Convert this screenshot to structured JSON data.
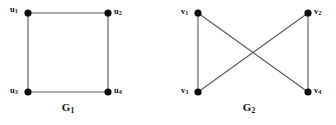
{
  "figure": {
    "width": 336,
    "height": 125,
    "background_color": "#ffffff",
    "edge_color": "#5a5a5a",
    "vertex_color": "#0d0d0d",
    "label_color": "#101010",
    "vertex_radius": 3.6
  },
  "graphs": [
    {
      "id": "G1",
      "caption_base": "G",
      "caption_sub": "1",
      "caption_text": "G1",
      "caption_x": 68,
      "caption_y": 111,
      "vertices": [
        {
          "id": "u1",
          "label_base": "u",
          "label_sub": "1",
          "label_text": "u1",
          "x": 28,
          "y": 13,
          "label_x": 10,
          "label_y": 12
        },
        {
          "id": "u2",
          "label_base": "u",
          "label_sub": "2",
          "label_text": "u2",
          "x": 108,
          "y": 13,
          "label_x": 114,
          "label_y": 14
        },
        {
          "id": "u3",
          "label_base": "u",
          "label_sub": "3",
          "label_text": "u3",
          "x": 28,
          "y": 92,
          "label_x": 10,
          "label_y": 93
        },
        {
          "id": "u4",
          "label_base": "u",
          "label_sub": "4",
          "label_text": "u4",
          "x": 108,
          "y": 92,
          "label_x": 114,
          "label_y": 93
        }
      ],
      "edges": [
        {
          "id": "u1-u2",
          "from": "u1",
          "to": "u2",
          "x1": 28,
          "y1": 13,
          "x2": 108,
          "y2": 13
        },
        {
          "id": "u1-u3",
          "from": "u1",
          "to": "u3",
          "x1": 28,
          "y1": 13,
          "x2": 28,
          "y2": 92
        },
        {
          "id": "u3-u4",
          "from": "u3",
          "to": "u4",
          "x1": 28,
          "y1": 92,
          "x2": 108,
          "y2": 92
        },
        {
          "id": "u2-u4",
          "from": "u2",
          "to": "u4",
          "x1": 108,
          "y1": 13,
          "x2": 108,
          "y2": 92
        }
      ]
    },
    {
      "id": "G2",
      "caption_base": "G",
      "caption_sub": "2",
      "caption_text": "G2",
      "caption_x": 249,
      "caption_y": 111,
      "vertices": [
        {
          "id": "v1",
          "label_base": "v",
          "label_sub": "1",
          "label_text": "v1",
          "x": 198,
          "y": 13,
          "label_x": 181,
          "label_y": 14
        },
        {
          "id": "v2",
          "label_base": "v",
          "label_sub": "2",
          "label_text": "v2",
          "x": 308,
          "y": 13,
          "label_x": 314,
          "label_y": 14
        },
        {
          "id": "v3",
          "label_base": "v",
          "label_sub": "3",
          "label_text": "v3",
          "x": 198,
          "y": 92,
          "label_x": 181,
          "label_y": 93
        },
        {
          "id": "v4",
          "label_base": "v",
          "label_sub": "4",
          "label_text": "v4",
          "x": 308,
          "y": 92,
          "label_x": 314,
          "label_y": 93
        }
      ],
      "edges": [
        {
          "id": "v1-v3",
          "from": "v1",
          "to": "v3",
          "x1": 198,
          "y1": 13,
          "x2": 198,
          "y2": 92
        },
        {
          "id": "v2-v4",
          "from": "v2",
          "to": "v4",
          "x1": 308,
          "y1": 13,
          "x2": 308,
          "y2": 92
        },
        {
          "id": "v1-v4",
          "from": "v1",
          "to": "v4",
          "x1": 198,
          "y1": 13,
          "x2": 308,
          "y2": 92
        },
        {
          "id": "v2-v3",
          "from": "v2",
          "to": "v3",
          "x1": 308,
          "y1": 13,
          "x2": 198,
          "y2": 92
        }
      ]
    }
  ]
}
